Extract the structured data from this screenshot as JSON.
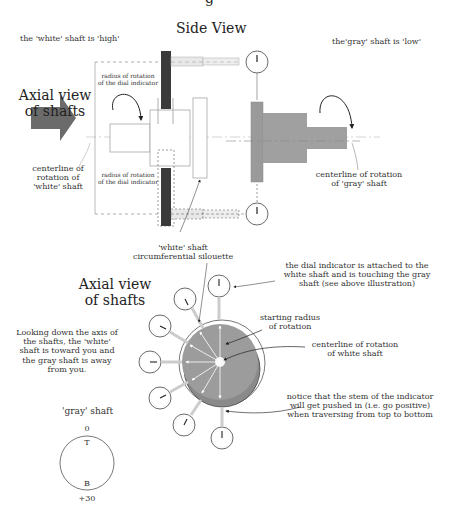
{
  "top": {
    "title_partial": "g",
    "side_view_title": "Side View",
    "white_high_note": "the 'white' shaft is 'high'",
    "gray_low_note": "the'gray' shaft is 'low'"
  },
  "side_view": {
    "axial_view_label_line1": "Axial view",
    "axial_view_label_line2": "of shafts",
    "centerline_white_line1": "centerline of",
    "centerline_white_line2": "rotation of",
    "centerline_white_line3": "'white' shaft",
    "radius_top_line1": "radius of rotation",
    "radius_top_line2": "of the dial indicator",
    "radius_bottom_line1": "radius of rotation",
    "radius_bottom_line2": "of the dial indicator",
    "centerline_gray_line1": "centerline of rotation",
    "centerline_gray_line2": "of 'gray' shaft",
    "white_silhouette_line1": "'white' shaft",
    "white_silhouette_line2": "circumferential silouette"
  },
  "axial_view": {
    "title_line1": "Axial view",
    "title_line2": "of shafts",
    "looking_down_lines": [
      "Looking down the axis of",
      "the shafts, the 'white'",
      "shaft is toward you and",
      "the gray shaft is away",
      "from you."
    ],
    "dial_attached_lines": [
      "the dial indicator is attached to the",
      "white shaft and is touching the gray",
      "shaft (see above illustration)"
    ],
    "starting_radius_line1": "starting radius",
    "starting_radius_line2": "of rotation",
    "centerline_white_line1": "centerline of rotation",
    "centerline_white_line2": "of white shaft",
    "notice_lines": [
      "notice that the stem of the indicator",
      "will get pushed in (i.e. go positive)",
      "when traversing from top to bottom"
    ]
  },
  "gray_shaft_dial": {
    "label": "'gray' shaft",
    "top_value": "0",
    "top_marker": "T",
    "bottom_marker": "B",
    "bottom_value": "+30"
  },
  "colors": {
    "dark_gray_fill": "#6e6e6e",
    "gray_shaft_fill": "#9a9a9a",
    "indicator_arm": "#3a3a3a",
    "line": "#444444"
  }
}
